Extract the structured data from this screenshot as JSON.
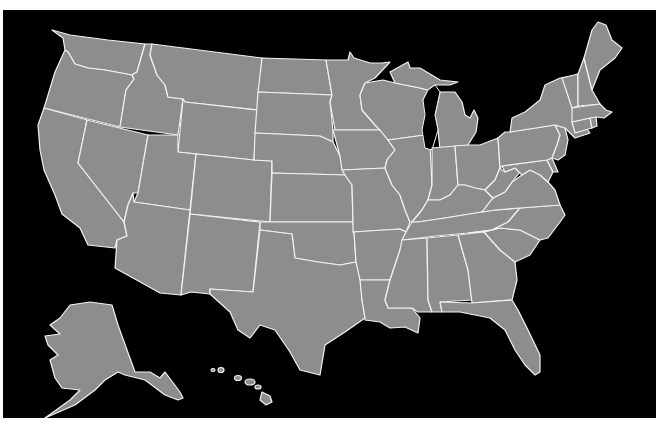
{
  "map": {
    "title": "United States map",
    "colors": {
      "background": "#000000",
      "state_fill": "#8d8d8d",
      "border": "#f2f2f2",
      "outer": "#ffffff"
    },
    "regions": [
      "Washington",
      "Oregon",
      "California",
      "Idaho",
      "Nevada",
      "Montana",
      "Wyoming",
      "Utah",
      "Arizona",
      "Colorado",
      "New Mexico",
      "North Dakota",
      "South Dakota",
      "Nebraska",
      "Kansas",
      "Oklahoma",
      "Texas",
      "Minnesota",
      "Iowa",
      "Missouri",
      "Arkansas",
      "Louisiana",
      "Wisconsin",
      "Illinois",
      "Michigan",
      "Indiana",
      "Ohio",
      "Kentucky",
      "Tennessee",
      "Mississippi",
      "Alabama",
      "Georgia",
      "Florida",
      "South Carolina",
      "North Carolina",
      "Virginia",
      "West Virginia",
      "Maryland",
      "Delaware",
      "Pennsylvania",
      "New Jersey",
      "New York",
      "Connecticut",
      "Rhode Island",
      "Massachusetts",
      "Vermont",
      "New Hampshire",
      "Maine",
      "Alaska",
      "Hawaii"
    ]
  }
}
